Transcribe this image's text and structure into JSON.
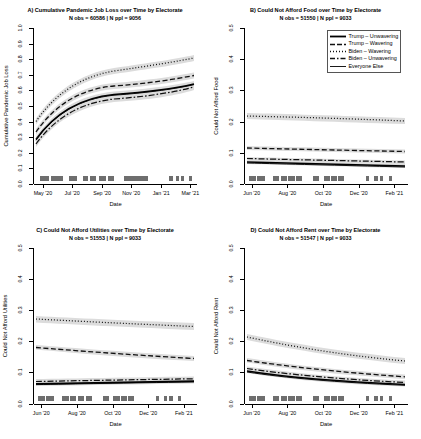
{
  "figure": {
    "background": "#ffffff",
    "axis_color": "#000000",
    "band_color": "#d9d9d9",
    "line_color": "#000000"
  },
  "legend": {
    "name": "electorate-legend",
    "panel": "B",
    "entries": [
      {
        "label": "Trump – Unwavering",
        "style": "solid"
      },
      {
        "label": "Trump – Wavering",
        "style": "dash-dot"
      },
      {
        "label": "Biden – Wavering",
        "style": "dotted"
      },
      {
        "label": "Biden – Unwavering",
        "style": "dash-dot-long"
      },
      {
        "label": "Everyone Else",
        "style": "solid-thin"
      }
    ]
  },
  "panels": [
    {
      "key": "A",
      "title": "A) Cumulative Pandemic Job Loss over Time by Electorate",
      "subtitle": "N obs = 60586 | N ppl = 9056",
      "xlabel": "Date",
      "ylabel": "Cumulative Pandemic Job Loss",
      "yticks": [
        "0.0",
        "0.1",
        "0.2",
        "0.3",
        "0.4",
        "0.5",
        "0.6",
        "0.7",
        "0.8",
        "0.9",
        "1.0"
      ],
      "ylim": [
        0.0,
        1.0
      ],
      "xticks": [
        "May '20",
        "Jul '20",
        "Sep '20",
        "Nov '20",
        "Jan '21",
        "Mar '21"
      ],
      "xtick_pos": [
        0.055,
        0.235,
        0.42,
        0.6,
        0.785,
        0.965
      ]
    },
    {
      "key": "B",
      "title": "B) Could Not Afford Food over Time by Electorate",
      "subtitle": "N obs = 51550 | N ppl = 9033",
      "xlabel": "Date",
      "ylabel": "Could Not Afford Food",
      "yticks": [
        "0.0",
        "0.1",
        "0.2",
        "0.3",
        "0.4",
        "0.5"
      ],
      "ylim": [
        0.0,
        0.5
      ],
      "xticks": [
        "Jun '20",
        "Aug '20",
        "Oct '20",
        "Dec '20",
        "Feb '21"
      ],
      "xtick_pos": [
        0.045,
        0.265,
        0.485,
        0.705,
        0.925
      ]
    },
    {
      "key": "C",
      "title": "C) Could Not Afford Utilities over Time by Electorate",
      "subtitle": "N obs = 51553 | N ppl = 9033",
      "xlabel": "Date",
      "ylabel": "Could Not Afford Utilities",
      "yticks": [
        "0.0",
        "0.1",
        "0.2",
        "0.3",
        "0.4",
        "0.5"
      ],
      "ylim": [
        0.0,
        0.5
      ],
      "xticks": [
        "Jun '20",
        "Aug '20",
        "Oct '20",
        "Dec '20",
        "Feb '21"
      ],
      "xtick_pos": [
        0.045,
        0.265,
        0.485,
        0.705,
        0.925
      ]
    },
    {
      "key": "D",
      "title": "D) Could Not Afford Rent over Time by Electorate",
      "subtitle": "N obs = 51547 | N ppl = 9033",
      "xlabel": "Date",
      "ylabel": "Could Not Afford Rent",
      "yticks": [
        "0.0",
        "0.1",
        "0.2",
        "0.3",
        "0.4",
        "0.5"
      ],
      "ylim": [
        0.0,
        0.5
      ],
      "xticks": [
        "Jun '20",
        "Aug '20",
        "Oct '20",
        "Dec '20",
        "Feb '21"
      ],
      "xtick_pos": [
        0.045,
        0.265,
        0.485,
        0.705,
        0.925
      ]
    }
  ],
  "chart_data": {
    "type": "line",
    "layout": "2x2 panel grid of smoothed trend lines with grey confidence bands and a date rug along the bottom axis",
    "grid": false,
    "legend_position": "panel B, top right, inside plot",
    "series_names": [
      "Trump – Unwavering",
      "Trump – Wavering",
      "Biden – Wavering",
      "Biden – Unwavering",
      "Everyone Else"
    ],
    "panels": [
      {
        "key": "A",
        "title": "A) Cumulative Pandemic Job Loss over Time by Electorate",
        "subtitle": "N obs = 60586 | N ppl = 9056",
        "xlabel": "Date",
        "ylabel": "Cumulative Pandemic Job Loss",
        "ylim": [
          0.0,
          1.0
        ],
        "x": [
          "May '20",
          "Jun '20",
          "Jul '20",
          "Aug '20",
          "Sep '20",
          "Oct '20",
          "Nov '20",
          "Dec '20",
          "Jan '21",
          "Feb '21",
          "Mar '21"
        ],
        "series": [
          {
            "name": "Biden – Wavering",
            "style": "dotted",
            "values": [
              0.45,
              0.53,
              0.6,
              0.645,
              0.672,
              0.688,
              0.698,
              0.706,
              0.712,
              0.718,
              0.725
            ]
          },
          {
            "name": "Trump – Wavering",
            "style": "dash-dot",
            "values": [
              0.42,
              0.49,
              0.545,
              0.578,
              0.597,
              0.611,
              0.62,
              0.628,
              0.635,
              0.641,
              0.648
            ]
          },
          {
            "name": "Trump – Unwavering",
            "style": "solid",
            "values": [
              0.385,
              0.45,
              0.495,
              0.524,
              0.543,
              0.556,
              0.566,
              0.574,
              0.582,
              0.59,
              0.6
            ]
          },
          {
            "name": "Biden – Unwavering",
            "style": "dash-dot-long",
            "values": [
              0.37,
              0.435,
              0.482,
              0.512,
              0.532,
              0.546,
              0.557,
              0.566,
              0.575,
              0.585,
              0.598
            ]
          },
          {
            "name": "Everyone Else",
            "style": "solid-thin",
            "values": [
              0.383,
              0.448,
              0.493,
              0.522,
              0.541,
              0.554,
              0.564,
              0.573,
              0.581,
              0.589,
              0.599
            ]
          }
        ]
      },
      {
        "key": "B",
        "title": "B) Could Not Afford Food over Time by Electorate",
        "subtitle": "N obs = 51550 | N ppl = 9033",
        "xlabel": "Date",
        "ylabel": "Could Not Afford Food",
        "ylim": [
          0.0,
          0.5
        ],
        "x": [
          "Jun '20",
          "Aug '20",
          "Oct '20",
          "Dec '20",
          "Feb '21"
        ],
        "series": [
          {
            "name": "Biden – Wavering",
            "style": "dotted",
            "values": [
              0.215,
              0.212,
              0.209,
              0.206,
              0.203
            ]
          },
          {
            "name": "Trump – Wavering",
            "style": "dash-dot",
            "values": [
              0.108,
              0.106,
              0.105,
              0.103,
              0.101
            ]
          },
          {
            "name": "Biden – Unwavering",
            "style": "dash-dot-long",
            "values": [
              0.072,
              0.07,
              0.069,
              0.068,
              0.066
            ]
          },
          {
            "name": "Trump – Unwavering",
            "style": "solid",
            "values": [
              0.062,
              0.059,
              0.057,
              0.055,
              0.053
            ]
          },
          {
            "name": "Everyone Else",
            "style": "solid-thin",
            "values": [
              0.06,
              0.058,
              0.056,
              0.054,
              0.052
            ]
          }
        ]
      },
      {
        "key": "C",
        "title": "C) Could Not Afford Utilities over Time by Electorate",
        "subtitle": "N obs = 51553 | N ppl = 9033",
        "xlabel": "Date",
        "ylabel": "Could Not Afford Utilities",
        "ylim": [
          0.0,
          0.5
        ],
        "x": [
          "Jun '20",
          "Aug '20",
          "Oct '20",
          "Dec '20",
          "Feb '21"
        ],
        "series": [
          {
            "name": "Biden – Wavering",
            "style": "dotted",
            "values": [
              0.268,
              0.262,
              0.258,
              0.254,
              0.25
            ]
          },
          {
            "name": "Trump – Wavering",
            "style": "dash-dot",
            "values": [
              0.172,
              0.163,
              0.156,
              0.15,
              0.145
            ]
          },
          {
            "name": "Biden – Unwavering",
            "style": "dash-dot-long",
            "values": [
              0.062,
              0.064,
              0.066,
              0.068,
              0.07
            ]
          },
          {
            "name": "Trump – Unwavering",
            "style": "solid",
            "values": [
              0.056,
              0.058,
              0.06,
              0.062,
              0.064
            ]
          },
          {
            "name": "Everyone Else",
            "style": "solid-thin",
            "values": [
              0.054,
              0.056,
              0.058,
              0.06,
              0.062
            ]
          }
        ]
      },
      {
        "key": "D",
        "title": "D) Could Not Afford Rent over Time by Electorate",
        "subtitle": "N obs = 51547 | N ppl = 9033",
        "xlabel": "Date",
        "ylabel": "Could Not Afford Rent",
        "ylim": [
          0.0,
          0.5
        ],
        "x": [
          "Jun '20",
          "Aug '20",
          "Oct '20",
          "Dec '20",
          "Feb '21"
        ],
        "series": [
          {
            "name": "Biden – Wavering",
            "style": "dotted",
            "values": [
              0.205,
              0.188,
              0.172,
              0.158,
              0.146
            ]
          },
          {
            "name": "Trump – Wavering",
            "style": "dash-dot",
            "values": [
              0.128,
              0.116,
              0.106,
              0.098,
              0.092
            ]
          },
          {
            "name": "Biden – Unwavering",
            "style": "dash-dot-long",
            "values": [
              0.1,
              0.088,
              0.079,
              0.072,
              0.067
            ]
          },
          {
            "name": "Trump – Unwavering",
            "style": "solid",
            "values": [
              0.092,
              0.081,
              0.073,
              0.066,
              0.061
            ]
          },
          {
            "name": "Everyone Else",
            "style": "solid-thin",
            "values": [
              0.089,
              0.078,
              0.07,
              0.064,
              0.059
            ]
          }
        ]
      }
    ]
  }
}
